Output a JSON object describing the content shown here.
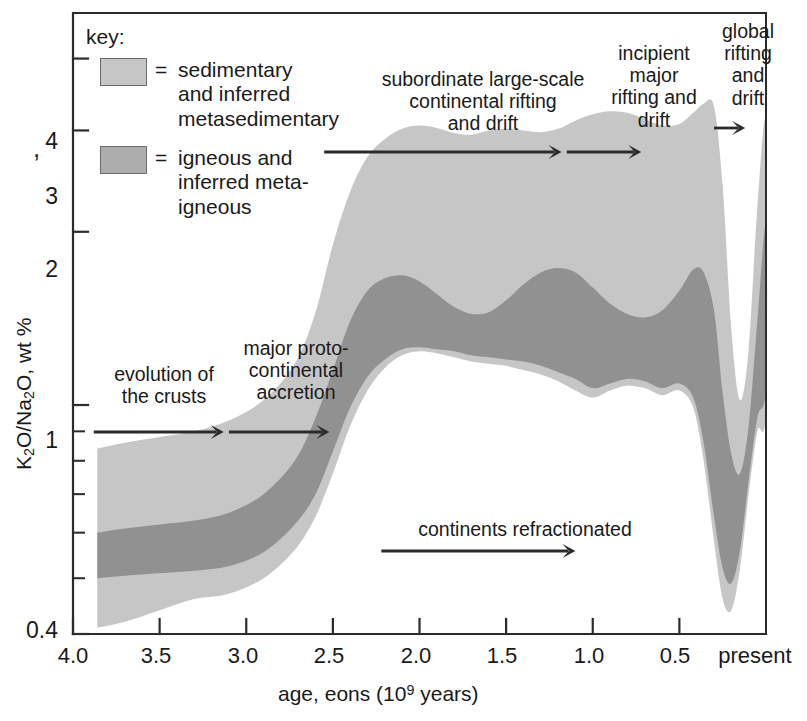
{
  "chart_data": {
    "type": "area",
    "title": "",
    "xlabel": "age, eons (10⁹ years)",
    "ylabel": "K₂O/Na₂O, wt %",
    "xlim": [
      4.0,
      0.0
    ],
    "ylim": [
      0.4,
      4.8
    ],
    "yscale": "log",
    "grid": false,
    "x_ticklabels": [
      "4.0",
      "3.5",
      "3.0",
      "2.5",
      "2.0",
      "1.5",
      "1.0",
      "0.5",
      "present"
    ],
    "x_tickvalues": [
      4.0,
      3.5,
      3.0,
      2.5,
      2.0,
      1.5,
      1.0,
      0.5,
      0.0
    ],
    "y_ticklabels": [
      "4",
      "3",
      "2",
      "1",
      "0.4"
    ],
    "y_tickvalues": [
      4,
      3,
      2,
      1,
      0.4
    ],
    "y_minor_tickvalues": [
      0.9,
      0.8,
      0.7,
      0.6,
      0.5
    ],
    "legend_position": "upper-left-inside",
    "series": [
      {
        "name": "sedimentary and inferred metasedimentary",
        "color": "#c6c6c6",
        "kind": "envelope",
        "x": [
          3.86,
          3.7,
          3.5,
          3.3,
          3.1,
          2.9,
          2.72,
          2.6,
          2.5,
          2.4,
          2.3,
          2.2,
          2.1,
          2.0,
          1.9,
          1.8,
          1.7,
          1.6,
          1.5,
          1.4,
          1.3,
          1.2,
          1.1,
          1.0,
          0.9,
          0.8,
          0.7,
          0.6,
          0.5,
          0.42,
          0.36,
          0.3,
          0.25,
          0.2,
          0.15,
          0.1,
          0.05,
          0.0
        ],
        "upper": [
          0.84,
          0.86,
          0.88,
          0.9,
          0.94,
          1.02,
          1.18,
          1.45,
          1.9,
          2.35,
          2.7,
          2.9,
          3.02,
          3.06,
          3.03,
          2.97,
          2.95,
          3.0,
          3.02,
          3.0,
          2.98,
          3.02,
          3.12,
          3.2,
          3.24,
          3.22,
          3.14,
          3.06,
          3.08,
          3.22,
          3.34,
          3.3,
          2.4,
          1.35,
          1.02,
          1.25,
          2.2,
          3.05
        ],
        "lower": [
          0.41,
          0.42,
          0.44,
          0.46,
          0.47,
          0.5,
          0.56,
          0.64,
          0.76,
          0.92,
          1.06,
          1.16,
          1.22,
          1.24,
          1.23,
          1.21,
          1.19,
          1.18,
          1.17,
          1.15,
          1.13,
          1.1,
          1.06,
          1.03,
          1.06,
          1.08,
          1.07,
          1.04,
          1.06,
          0.99,
          0.8,
          0.58,
          0.46,
          0.44,
          0.52,
          0.7,
          0.9,
          1.0
        ]
      },
      {
        "name": "igneous and inferred meta-igneous",
        "color": "#919191",
        "kind": "envelope",
        "x": [
          3.86,
          3.7,
          3.5,
          3.3,
          3.1,
          2.9,
          2.72,
          2.6,
          2.5,
          2.4,
          2.3,
          2.2,
          2.1,
          2.0,
          1.9,
          1.8,
          1.7,
          1.6,
          1.5,
          1.4,
          1.3,
          1.2,
          1.1,
          1.0,
          0.9,
          0.8,
          0.7,
          0.6,
          0.5,
          0.42,
          0.36,
          0.3,
          0.25,
          0.2,
          0.15,
          0.1,
          0.05,
          0.0
        ],
        "upper": [
          0.6,
          0.61,
          0.62,
          0.63,
          0.65,
          0.7,
          0.8,
          0.95,
          1.15,
          1.4,
          1.58,
          1.66,
          1.68,
          1.64,
          1.56,
          1.48,
          1.44,
          1.45,
          1.52,
          1.62,
          1.7,
          1.73,
          1.7,
          1.6,
          1.5,
          1.44,
          1.42,
          1.46,
          1.58,
          1.72,
          1.7,
          1.46,
          1.05,
          0.82,
          0.76,
          0.92,
          1.4,
          2.05
        ],
        "lower": [
          0.5,
          0.505,
          0.51,
          0.515,
          0.525,
          0.555,
          0.62,
          0.7,
          0.83,
          0.99,
          1.12,
          1.2,
          1.25,
          1.26,
          1.25,
          1.24,
          1.22,
          1.21,
          1.2,
          1.19,
          1.17,
          1.14,
          1.11,
          1.07,
          1.09,
          1.11,
          1.1,
          1.07,
          1.09,
          1.03,
          0.86,
          0.64,
          0.52,
          0.49,
          0.56,
          0.74,
          0.95,
          1.08
        ]
      }
    ],
    "annotations": [
      {
        "id": "evolution-of-the-crusts",
        "text": "evolution of\nthe crusts",
        "arrow": {
          "from": 3.88,
          "to": 3.13
        }
      },
      {
        "id": "major-protocontinental-accretion",
        "text": "major proto-\ncontinental\naccretion",
        "arrow": {
          "from": 3.1,
          "to": 2.52
        }
      },
      {
        "id": "subordinate-large-scale-rifting",
        "text": "subordinate large-scale\ncontinental rifting\nand drift",
        "arrow": {
          "from": 2.55,
          "to": 1.18
        }
      },
      {
        "id": "incipient-major-rifting",
        "text": "incipient\nmajor\nrifting and\ndrift",
        "arrow": {
          "from": 1.15,
          "to": 0.72
        }
      },
      {
        "id": "global-rifting-and-drift",
        "text": "global\nrifting\nand\ndrift",
        "arrow": {
          "from": 0.3,
          "to": 0.12
        }
      },
      {
        "id": "continents-refractionated",
        "text": "continents refractionated",
        "arrow": {
          "from": 2.22,
          "to": 1.1
        }
      }
    ]
  },
  "legend": {
    "title": "key:",
    "equals": "=",
    "items": [
      {
        "label": "sedimentary\nand inferred\nmetasedimentary",
        "color": "#c6c6c6"
      },
      {
        "label": "igneous and\ninferred meta-\nigneous",
        "color": "#adadad"
      }
    ]
  },
  "axes": {
    "y_label_parts": {
      "k2o": "K",
      "sub2a": "2",
      "o_a": "O/Na",
      "sub2b": "2",
      "o_b": "O, wt %"
    },
    "y_label_plain": "K2O/Na2O, wt %",
    "x_label_pre": "age, eons  (10",
    "x_label_sup": "9",
    "x_label_post": " years)"
  },
  "colors": {
    "light_band": "#c6c6c6",
    "dark_band": "#919191",
    "axis": "#2b2b2b",
    "text": "#1a1a1a",
    "background": "#ffffff"
  }
}
